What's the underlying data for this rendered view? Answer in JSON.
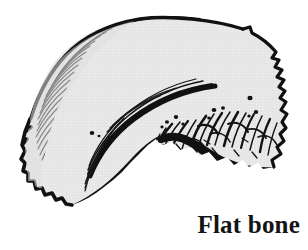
{
  "figure": {
    "caption": "Flat bone",
    "colors": {
      "background": "#ffffff",
      "ink": "#111111",
      "bone_fill": "#e7e7e7",
      "bone_fill_shade": "#dedede",
      "caption_color": "#141414"
    },
    "canvas": {
      "width": 308,
      "height": 250
    },
    "parts": [
      {
        "name": "outer-compact-bone-edge",
        "label": "",
        "style": "thick-dark-curved-outline"
      },
      {
        "name": "diploe-spongy-layer",
        "label": "",
        "style": "radiating-hatch-strokes"
      },
      {
        "name": "inner-compact-bone-arc",
        "label": "",
        "style": "bold-arc-stroke"
      },
      {
        "name": "serrated-left-margin",
        "label": "",
        "style": "scalloped-wavy-edge"
      },
      {
        "name": "jagged-right-margin",
        "label": "",
        "style": "irregular-step-edge"
      },
      {
        "name": "nutrient-canal-dots",
        "label": "",
        "style": "small-black-dots"
      },
      {
        "name": "heavy-basal-band",
        "label": "",
        "style": "solid-black-band"
      }
    ]
  }
}
